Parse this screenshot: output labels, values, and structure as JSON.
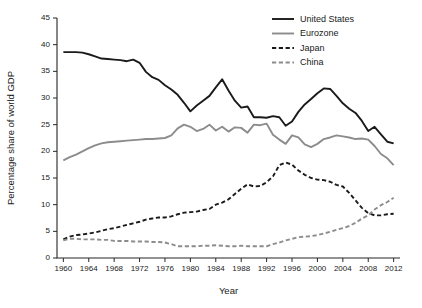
{
  "chart_data": {
    "type": "line",
    "title": "",
    "xlabel": "Year",
    "ylabel": "Percentage share of world GDP",
    "xlim": [
      1959,
      2013
    ],
    "ylim": [
      0,
      45
    ],
    "yticks": [
      0,
      5,
      10,
      15,
      20,
      25,
      30,
      35,
      40,
      45
    ],
    "xticks": [
      1960,
      1964,
      1968,
      1972,
      1976,
      1980,
      1984,
      1988,
      1992,
      1996,
      2000,
      2004,
      2008,
      2012
    ],
    "grid": false,
    "legend_position": "top-right",
    "x": [
      1960,
      1961,
      1962,
      1963,
      1964,
      1965,
      1966,
      1967,
      1968,
      1969,
      1970,
      1971,
      1972,
      1973,
      1974,
      1975,
      1976,
      1977,
      1978,
      1979,
      1980,
      1981,
      1982,
      1983,
      1984,
      1985,
      1986,
      1987,
      1988,
      1989,
      1990,
      1991,
      1992,
      1993,
      1994,
      1995,
      1996,
      1997,
      1998,
      1999,
      2000,
      2001,
      2002,
      2003,
      2004,
      2005,
      2006,
      2007,
      2008,
      2009,
      2010,
      2011,
      2012
    ],
    "series": [
      {
        "name": "United States",
        "color": "#1a1a1a",
        "style": "solid",
        "width": 1.9,
        "values": [
          38.6,
          38.6,
          38.6,
          38.5,
          38.2,
          37.8,
          37.4,
          37.3,
          37.2,
          37.1,
          36.9,
          37.2,
          36.6,
          34.9,
          33.9,
          33.4,
          32.4,
          31.6,
          30.6,
          29.1,
          27.5,
          28.6,
          29.5,
          30.4,
          32.0,
          33.5,
          31.4,
          29.5,
          28.2,
          28.4,
          26.4,
          26.4,
          26.3,
          26.6,
          26.4,
          24.8,
          25.6,
          27.4,
          28.8,
          29.8,
          30.9,
          31.8,
          31.7,
          30.4,
          29.0,
          28.0,
          27.2,
          25.7,
          23.8,
          24.6,
          23.2,
          21.8,
          21.5
        ]
      },
      {
        "name": "Eurozone",
        "color": "#8c8c8c",
        "style": "solid",
        "width": 1.9,
        "values": [
          18.3,
          18.9,
          19.4,
          20.0,
          20.6,
          21.1,
          21.5,
          21.7,
          21.8,
          21.9,
          22.0,
          22.1,
          22.2,
          22.3,
          22.3,
          22.4,
          22.5,
          23.0,
          24.3,
          25.0,
          24.6,
          23.8,
          24.2,
          25.0,
          23.9,
          24.6,
          23.7,
          24.5,
          24.4,
          23.5,
          25.0,
          24.9,
          25.2,
          23.1,
          22.2,
          21.4,
          23.0,
          22.6,
          21.3,
          20.8,
          21.4,
          22.3,
          22.6,
          23.0,
          22.8,
          22.6,
          22.3,
          22.4,
          22.2,
          21.0,
          19.5,
          18.7,
          17.4
        ]
      },
      {
        "name": "Japan",
        "color": "#1a1a1a",
        "style": "dashed",
        "width": 1.9,
        "values": [
          3.5,
          4.0,
          4.3,
          4.4,
          4.6,
          4.8,
          5.1,
          5.4,
          5.6,
          5.9,
          6.2,
          6.5,
          6.8,
          7.2,
          7.4,
          7.6,
          7.6,
          7.8,
          8.2,
          8.5,
          8.6,
          8.7,
          9.0,
          9.2,
          10.0,
          10.4,
          11.0,
          12.0,
          13.0,
          13.8,
          13.4,
          13.5,
          14.2,
          15.3,
          17.4,
          17.9,
          17.5,
          16.4,
          15.6,
          15.0,
          14.7,
          14.6,
          14.3,
          13.7,
          13.4,
          12.2,
          10.8,
          9.4,
          8.4,
          8.0,
          8.0,
          8.2,
          8.3
        ]
      },
      {
        "name": "China",
        "color": "#8c8c8c",
        "style": "dashed",
        "width": 1.9,
        "values": [
          3.3,
          3.6,
          3.6,
          3.5,
          3.5,
          3.5,
          3.4,
          3.4,
          3.2,
          3.2,
          3.2,
          3.1,
          3.1,
          3.1,
          3.0,
          3.0,
          2.9,
          2.6,
          2.2,
          2.2,
          2.2,
          2.2,
          2.3,
          2.3,
          2.4,
          2.3,
          2.2,
          2.2,
          2.3,
          2.2,
          2.2,
          2.2,
          2.2,
          2.6,
          2.9,
          3.3,
          3.6,
          3.9,
          4.0,
          4.1,
          4.3,
          4.6,
          4.9,
          5.3,
          5.6,
          6.0,
          6.6,
          7.4,
          8.0,
          9.1,
          9.9,
          10.5,
          11.3
        ]
      }
    ],
    "legend": [
      {
        "label": "United States",
        "color": "#1a1a1a",
        "style": "solid"
      },
      {
        "label": "Eurozone",
        "color": "#8c8c8c",
        "style": "solid"
      },
      {
        "label": "Japan",
        "color": "#1a1a1a",
        "style": "dashed"
      },
      {
        "label": "China",
        "color": "#8c8c8c",
        "style": "dashed"
      }
    ]
  },
  "layout": {
    "plot_left": 57,
    "plot_right": 400,
    "plot_top": 18,
    "plot_bottom": 258,
    "axis_color": "#262626",
    "background": "#ffffff"
  }
}
